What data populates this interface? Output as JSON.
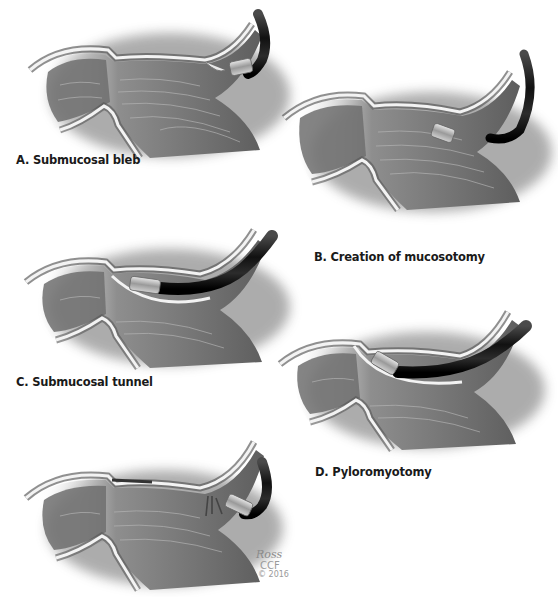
{
  "figure": {
    "colors": {
      "tissue_dark": "#3a3a3a",
      "tissue_mid": "#7d7d7d",
      "tissue_light": "#c9c9c9",
      "wall_highlight": "#f2f2f2",
      "scope_black": "#141414",
      "label_text": "#1a1a1a",
      "signature_text": "#9a9a9a"
    },
    "panels": [
      {
        "id": "A",
        "label": "A. Submucosal bleb",
        "instrument": "endoscope-cap-injection"
      },
      {
        "id": "B",
        "label": "B. Creation of mucosotomy",
        "instrument": "endoscope-cap-incision"
      },
      {
        "id": "C",
        "label": "C. Submucosal tunnel",
        "instrument": "endoscope-in-tunnel"
      },
      {
        "id": "D",
        "label": "D. Pyloromyotomy",
        "instrument": "endoscope-knife-at-pylorus"
      },
      {
        "id": "E",
        "label": "",
        "instrument": "endoscope-clip-closure"
      }
    ],
    "signature": {
      "name": "Ross",
      "org": "CCF",
      "year": "© 2016"
    }
  }
}
